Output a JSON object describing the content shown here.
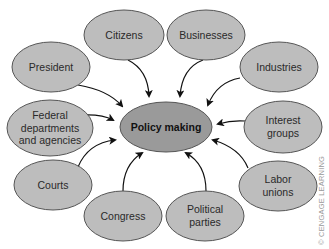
{
  "diagram": {
    "center": {
      "label": "Policy making",
      "cx": 166,
      "cy": 127,
      "rx": 46,
      "ry": 25,
      "fill": "#9a9a9a"
    },
    "node_fill": "#bdbdbd",
    "stroke": "#555555",
    "nodes": [
      {
        "id": "citizens",
        "lines": [
          "Citizens"
        ],
        "cx": 124,
        "cy": 35,
        "rx": 40,
        "ry": 25
      },
      {
        "id": "businesses",
        "lines": [
          "Businesses"
        ],
        "cx": 206,
        "cy": 35,
        "rx": 39,
        "ry": 25
      },
      {
        "id": "president",
        "lines": [
          "President"
        ],
        "cx": 51,
        "cy": 67,
        "rx": 39,
        "ry": 25
      },
      {
        "id": "industries",
        "lines": [
          "Industries"
        ],
        "cx": 279,
        "cy": 67,
        "rx": 39,
        "ry": 25
      },
      {
        "id": "federal",
        "lines": [
          "Federal",
          "departments",
          "and agencies"
        ],
        "cx": 50,
        "cy": 128,
        "rx": 43,
        "ry": 28
      },
      {
        "id": "interest-groups",
        "lines": [
          "Interest",
          "groups"
        ],
        "cx": 283,
        "cy": 127,
        "rx": 39,
        "ry": 26
      },
      {
        "id": "courts",
        "lines": [
          "Courts"
        ],
        "cx": 53,
        "cy": 185,
        "rx": 39,
        "ry": 25
      },
      {
        "id": "labor-unions",
        "lines": [
          "Labor",
          "unions"
        ],
        "cx": 278,
        "cy": 186,
        "rx": 39,
        "ry": 25
      },
      {
        "id": "congress",
        "lines": [
          "Congress"
        ],
        "cx": 123,
        "cy": 216,
        "rx": 39,
        "ry": 25
      },
      {
        "id": "political-parties",
        "lines": [
          "Political",
          "parties"
        ],
        "cx": 205,
        "cy": 216,
        "rx": 39,
        "ry": 25
      }
    ],
    "edges": [
      {
        "from": "president",
        "path": "M 78 85 Q 108 90 122 106"
      },
      {
        "from": "citizens",
        "path": "M 128 60 Q 148 70 149 96"
      },
      {
        "from": "businesses",
        "path": "M 203 60 Q 182 68 180 96"
      },
      {
        "from": "industries",
        "path": "M 240 78 Q 217 82 208 105"
      },
      {
        "from": "federal",
        "path": "M 82 115 Q 102 114 113 120"
      },
      {
        "from": "interest-groups",
        "path": "M 245 121 Q 232 120 218 124"
      },
      {
        "from": "courts",
        "path": "M 78 167 Q 88 143 115 140"
      },
      {
        "from": "labor-unions",
        "path": "M 248 168 Q 240 148 213 140"
      },
      {
        "from": "congress",
        "path": "M 123 191 Q 123 165 142 153"
      },
      {
        "from": "political-parties",
        "path": "M 206 191 Q 206 164 186 153"
      }
    ],
    "credit": "© CENGAGE LEARNING"
  }
}
